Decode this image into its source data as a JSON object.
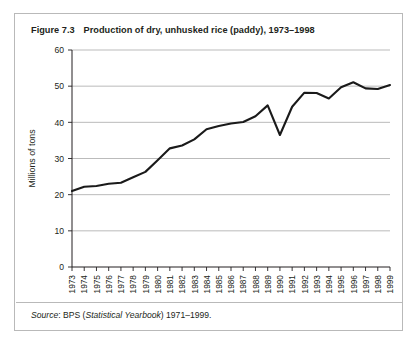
{
  "figure": {
    "number": "Figure 7.3",
    "title": "Production of dry, unhusked rice (paddy), 1973–1998",
    "source_prefix": "Source",
    "source_sep": ": BPS (",
    "source_italic": "Statistical Yearbook",
    "source_suffix": ") 1971–1999."
  },
  "colors": {
    "frame": "#b9b9b9",
    "axis": "#231f20",
    "grid": "#9d9d9d",
    "line": "#1a1a1a",
    "text": "#231f20",
    "background": "#ffffff"
  },
  "chart_data": {
    "type": "line",
    "title": "Production of dry, unhusked rice (paddy), 1973–1998",
    "xlabel": "",
    "ylabel": "Millions of tons",
    "ylim": [
      0,
      60
    ],
    "yticks": [
      0,
      10,
      20,
      30,
      40,
      50,
      60
    ],
    "grid": true,
    "legend": "none",
    "x": [
      1973,
      1974,
      1975,
      1976,
      1977,
      1978,
      1979,
      1980,
      1981,
      1982,
      1983,
      1984,
      1985,
      1986,
      1987,
      1988,
      1989,
      1990,
      1991,
      1992,
      1993,
      1994,
      1995,
      1996,
      1997,
      1998,
      1999
    ],
    "categories": [
      "1973",
      "1974",
      "1975",
      "1976",
      "1977",
      "1978",
      "1979",
      "1980",
      "1981",
      "1982",
      "1983",
      "1984",
      "1985",
      "1986",
      "1987",
      "1988",
      "1989",
      "1990",
      "1991",
      "1992",
      "1993",
      "1994",
      "1995",
      "1996",
      "1997",
      "1998",
      "1999"
    ],
    "series": [
      {
        "name": "Paddy production",
        "values": [
          21.0,
          22.2,
          22.4,
          23.0,
          23.3,
          24.8,
          26.3,
          29.5,
          32.8,
          33.6,
          35.3,
          38.1,
          39.0,
          39.7,
          40.1,
          41.7,
          44.7,
          36.5,
          44.3,
          48.2,
          48.1,
          46.6,
          49.7,
          51.1,
          49.4,
          49.2,
          50.3
        ]
      }
    ]
  }
}
